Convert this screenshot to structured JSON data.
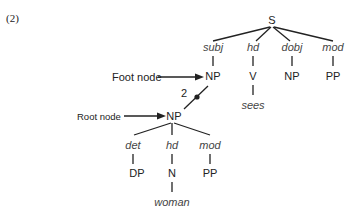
{
  "example_number": "(2)",
  "tree": {
    "root": {
      "label": "S"
    },
    "children": [
      {
        "relation": "subj",
        "label": "NP"
      },
      {
        "relation": "hd",
        "label": "V",
        "lexeme": "sees"
      },
      {
        "relation": "dobj",
        "label": "NP"
      },
      {
        "relation": "mod",
        "label": "PP"
      }
    ]
  },
  "subtree": {
    "root": {
      "label": "NP"
    },
    "children": [
      {
        "relation": "det",
        "label": "DP"
      },
      {
        "relation": "hd",
        "label": "N",
        "lexeme": "woman"
      },
      {
        "relation": "mod",
        "label": "PP"
      }
    ]
  },
  "annotations": {
    "foot_node": "Foot node",
    "root_node": "Root node",
    "substitution_index": "2"
  }
}
